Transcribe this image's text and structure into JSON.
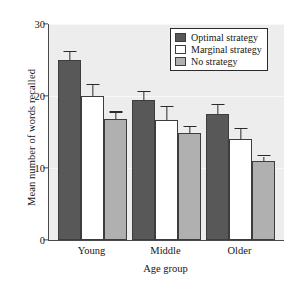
{
  "chart_data": {
    "type": "bar",
    "title": "",
    "xlabel": "Age group",
    "ylabel": "Mean number of words recalled",
    "categories": [
      "Young",
      "Middle",
      "Older"
    ],
    "ylim": [
      0,
      30
    ],
    "yticks": [
      0,
      10,
      20,
      30
    ],
    "ytick_labels": [
      "0",
      "10",
      "20",
      "30"
    ],
    "grid": true,
    "legend_position": "top-right",
    "series": [
      {
        "name": "Optimal strategy",
        "color": "#585858",
        "values": [
          25.0,
          19.5,
          17.5
        ],
        "errors": [
          1.1,
          1.0,
          1.2
        ]
      },
      {
        "name": "Marginal strategy",
        "color": "#ffffff",
        "values": [
          20.0,
          16.7,
          14.0
        ],
        "errors": [
          1.5,
          1.8,
          1.4
        ]
      },
      {
        "name": "No strategy",
        "color": "#b0b0b0",
        "values": [
          16.8,
          14.9,
          11.0
        ],
        "errors": [
          0.9,
          0.8,
          0.6
        ]
      }
    ]
  },
  "legend": {
    "items": [
      {
        "label": "Optimal strategy"
      },
      {
        "label": "Marginal strategy"
      },
      {
        "label": "No strategy"
      }
    ]
  },
  "axes": {
    "y_title": "Mean number of words recalled",
    "x_title": "Age group"
  }
}
